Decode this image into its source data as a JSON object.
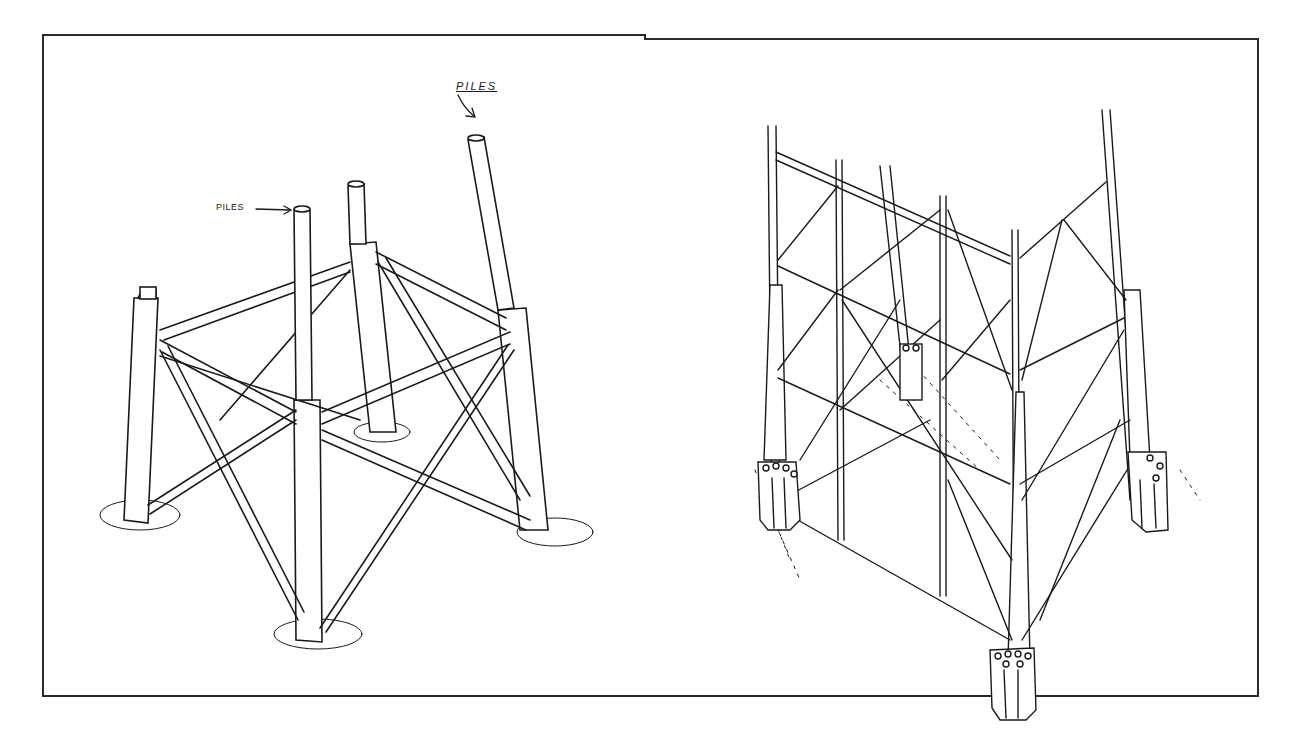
{
  "figure": {
    "panels": [
      {
        "id": "left",
        "description": "Four-leg jacket template with piles driven through legs",
        "labels": {
          "piles_arrow_label": "PILES",
          "piles_handwritten_label": "PILES"
        },
        "pile_markings": [
          "70",
          "60",
          "50",
          "40"
        ],
        "legs": 4
      },
      {
        "id": "right",
        "description": "Braced jacket structure with skirt pile clusters at leg bases",
        "legs": 4,
        "pile_sleeve_clusters": 4
      }
    ],
    "colors": {
      "line": "#1a1a1a",
      "background": "#ffffff"
    }
  }
}
